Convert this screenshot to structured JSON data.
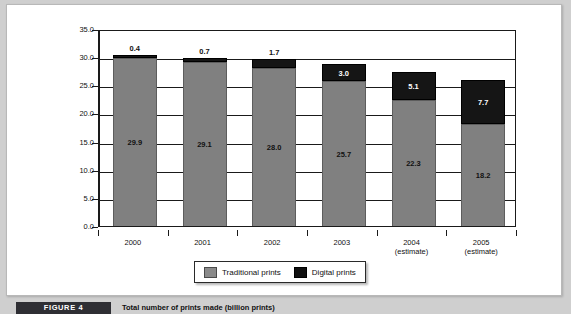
{
  "figure": {
    "tag": "FIGURE 4",
    "caption": "Total number of prints made (billion prints)"
  },
  "legend": {
    "items": [
      {
        "label": "Traditional prints",
        "color": "#808080",
        "swatch": "gray-swatch"
      },
      {
        "label": "Digital prints",
        "color": "#151515",
        "swatch": "black-swatch"
      }
    ]
  },
  "chart_data": {
    "type": "bar",
    "stacked": true,
    "title": "Total number of prints made (billion prints)",
    "xlabel": "",
    "ylabel": "",
    "ylim": [
      0.0,
      35.0
    ],
    "ytick_step": 5.0,
    "grid": true,
    "legend_position": "bottom-center",
    "categories": [
      "2000",
      "2001",
      "2002",
      "2003",
      "2004",
      "2005"
    ],
    "category_sublabels": [
      "",
      "",
      "",
      "",
      "(estimate)",
      "(estimate)"
    ],
    "ytick_labels": [
      "35.0",
      "30.0",
      "25.0",
      "20.0",
      "15.0",
      "10.0",
      "5.0",
      "0.0"
    ],
    "ytick_values": [
      35.0,
      30.0,
      25.0,
      20.0,
      15.0,
      10.0,
      5.0,
      0.0
    ],
    "series": [
      {
        "name": "Traditional prints",
        "color": "#808080",
        "values": [
          29.9,
          29.1,
          28.0,
          25.7,
          22.3,
          18.2
        ],
        "value_labels": [
          "29.9",
          "29.1",
          "28.0",
          "25.7",
          "22.3",
          "18.2"
        ],
        "label_color": "#111111"
      },
      {
        "name": "Digital prints",
        "color": "#151515",
        "values": [
          0.4,
          0.7,
          1.7,
          3.0,
          5.1,
          7.7
        ],
        "value_labels": [
          "0.4",
          "0.7",
          "1.7",
          "3.0",
          "5.1",
          "7.7"
        ],
        "label_color": [
          "#111111",
          "#111111",
          "#111111",
          "#ffffff",
          "#ffffff",
          "#ffffff"
        ],
        "label_placement": [
          "above",
          "above",
          "above",
          "inside",
          "inside",
          "inside"
        ]
      }
    ],
    "totals": [
      30.3,
      29.8,
      29.7,
      28.7,
      27.4,
      25.9
    ]
  }
}
